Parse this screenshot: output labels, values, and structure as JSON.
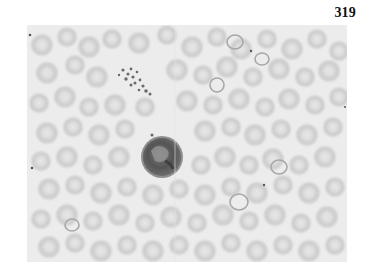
{
  "page": {
    "number": "319"
  },
  "figure": {
    "type": "blood-smear-micrograph",
    "colormode": "grayscale",
    "elements": {
      "leukocyte": {
        "cx": 135,
        "cy": 132,
        "r": 21
      },
      "platelet_cluster": {
        "x": 88,
        "y": 40,
        "w": 35,
        "h": 32
      }
    }
  }
}
